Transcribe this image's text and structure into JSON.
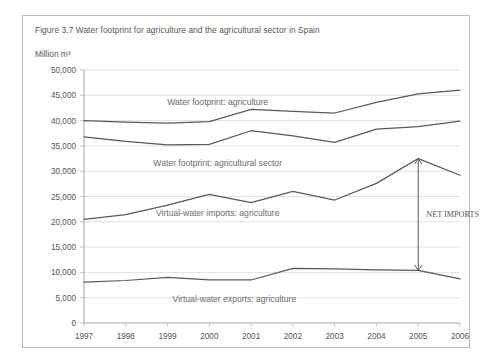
{
  "figure": {
    "title": "Figure 3.7 Water footprint for agriculture and the agricultural sector in Spain",
    "unit_label": "Million m³"
  },
  "annotation": {
    "net_imports_label": "NET IMPORTS"
  },
  "colors": {
    "line": "#595959",
    "grid": "#d4d4d4",
    "axis": "#9a9a9a",
    "text": "#555555",
    "border": "#b9b9b9",
    "background": "#ffffff"
  },
  "chart_data": {
    "type": "line",
    "title": "Figure 3.7 Water footprint for agriculture and the agricultural sector in Spain",
    "xlabel": "",
    "ylabel": "Million m³",
    "ylim": [
      0,
      50000
    ],
    "ytick_labels": [
      "0",
      "5,000",
      "10,000",
      "15,000",
      "20,000",
      "25,000",
      "30,000",
      "35,000",
      "40,000",
      "45,000",
      "50,000"
    ],
    "ytick_values": [
      0,
      5000,
      10000,
      15000,
      20000,
      25000,
      30000,
      35000,
      40000,
      45000,
      50000
    ],
    "grid": true,
    "legend": "inline-labels",
    "categories": [
      "1997",
      "1998",
      "1999",
      "2000",
      "2001",
      "2002",
      "2003",
      "2004",
      "2005",
      "2006"
    ],
    "x": [
      1997,
      1998,
      1999,
      2000,
      2001,
      2002,
      2003,
      2004,
      2005,
      2006
    ],
    "series": [
      {
        "name": "Water footprint: agriculture",
        "label": "Water footprint: agriculture",
        "values": [
          40000,
          39700,
          39500,
          39800,
          42200,
          41800,
          41500,
          43600,
          45300,
          46000
        ]
      },
      {
        "name": "Water footprint: agricultural sector",
        "label": "Water footprint: agricultural sector",
        "values": [
          36800,
          35900,
          35200,
          35300,
          38000,
          37000,
          35700,
          38300,
          38800,
          39900
        ]
      },
      {
        "name": "Virtual-water imports: agriculture",
        "label": "Virtual-water imports: agriculture",
        "values": [
          20500,
          21400,
          23300,
          25400,
          23800,
          26000,
          24300,
          27600,
          32500,
          29200
        ]
      },
      {
        "name": "Virtual-water exports: agriculture",
        "label": "Virtual-water exports: agriculture",
        "values": [
          8100,
          8400,
          9000,
          8500,
          8500,
          10800,
          10700,
          10500,
          10400,
          8700
        ]
      }
    ],
    "annotations": [
      {
        "text": "NET IMPORTS",
        "at_year": 2005,
        "from_value": 32500,
        "to_value": 10400,
        "style": "double-headed-vertical-arrow"
      }
    ]
  }
}
